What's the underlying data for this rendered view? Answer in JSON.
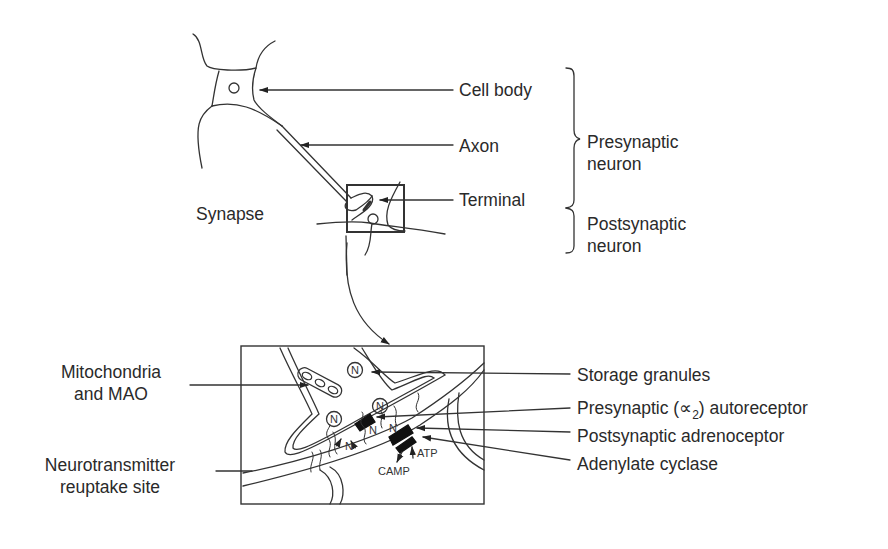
{
  "diagram": {
    "top": {
      "labels": {
        "cell_body": "Cell body",
        "axon": "Axon",
        "terminal": "Terminal",
        "synapse": "Synapse"
      },
      "brackets": {
        "presynaptic_line1": "Presynaptic",
        "presynaptic_line2": "neuron",
        "postsynaptic_line1": "Postsynaptic",
        "postsynaptic_line2": "neuron"
      }
    },
    "detail": {
      "left_labels": {
        "mitochondria_line1": "Mitochondria",
        "mitochondria_line2": "and MAO",
        "reuptake_line1": "Neurotransmitter",
        "reuptake_line2": "reuptake site"
      },
      "right_labels": {
        "storage_granules": "Storage granules",
        "presynaptic_autoreceptor_prefix": "Presynaptic (",
        "alpha_symbol": "∝",
        "alpha_subscript": "2",
        "presynaptic_autoreceptor_suffix": ") autoreceptor",
        "postsynaptic_adrenoceptor": "Postsynaptic adrenoceptor",
        "adenylate_cyclase": "Adenylate cyclase"
      },
      "inner_labels": {
        "granule_symbol": "N",
        "neurotransmitter": "N",
        "atp": "ATP",
        "camp": "CAMP"
      }
    }
  }
}
